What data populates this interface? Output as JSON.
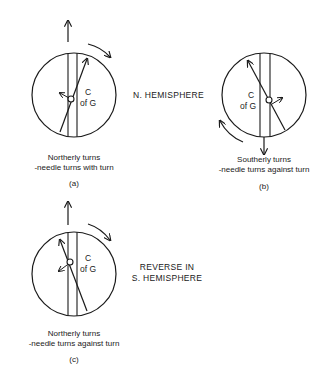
{
  "figure": {
    "labels": {
      "n_hemisphere": "N. HEMISPHERE",
      "reverse_line1": "REVERSE IN",
      "reverse_line2": "S. HEMISPHERE"
    },
    "panels": [
      {
        "id": "a",
        "cg_top": "C",
        "cg_bottom": "of G",
        "caption_line1": "Northerly turns",
        "caption_line2": "-needle turns with turn",
        "sublabel": "(a)",
        "heading_arrow": "up",
        "turn_arrow": "clockwise"
      },
      {
        "id": "b",
        "cg_top": "C",
        "cg_bottom": "of G",
        "caption_line1": "Southerly turns",
        "caption_line2": "-needle turns against turn",
        "sublabel": "(b)",
        "heading_arrow": "down",
        "turn_arrow": "clockwise"
      },
      {
        "id": "c",
        "cg_top": "C",
        "cg_bottom": "of G",
        "caption_line1": "Northerly turns",
        "caption_line2": "-needle turns against turn",
        "sublabel": "(c)",
        "heading_arrow": "up",
        "turn_arrow": "clockwise"
      }
    ]
  }
}
